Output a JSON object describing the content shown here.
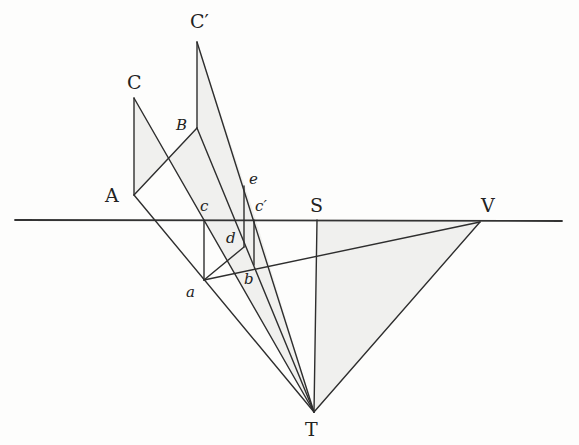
{
  "figure": {
    "type": "perspective-construction",
    "labels": {
      "C": "C",
      "C_prime": "C′",
      "B": "B",
      "A": "A",
      "c": "c",
      "c_prime": "c′",
      "e": "e",
      "d": "d",
      "a": "a",
      "b": "b",
      "S": "S",
      "V": "V",
      "T": "T"
    },
    "points": {
      "C": [
        134,
        98
      ],
      "A": [
        134,
        195
      ],
      "B": [
        197,
        128
      ],
      "C_prime": [
        197,
        42
      ],
      "c": [
        204,
        220
      ],
      "c_prime": [
        254,
        220
      ],
      "e": [
        244,
        183
      ],
      "d": [
        240,
        248
      ],
      "a": [
        202,
        280
      ],
      "b": [
        250,
        268
      ],
      "S": [
        317,
        220
      ],
      "V": [
        480,
        222
      ],
      "T": [
        314,
        412
      ]
    },
    "horizon": {
      "y": 220,
      "x_start": 15,
      "x_end": 560
    },
    "colors": {
      "ink": "#2e2e2e",
      "paper": "#fdfdfc",
      "shade": "#e6e6e2"
    }
  }
}
